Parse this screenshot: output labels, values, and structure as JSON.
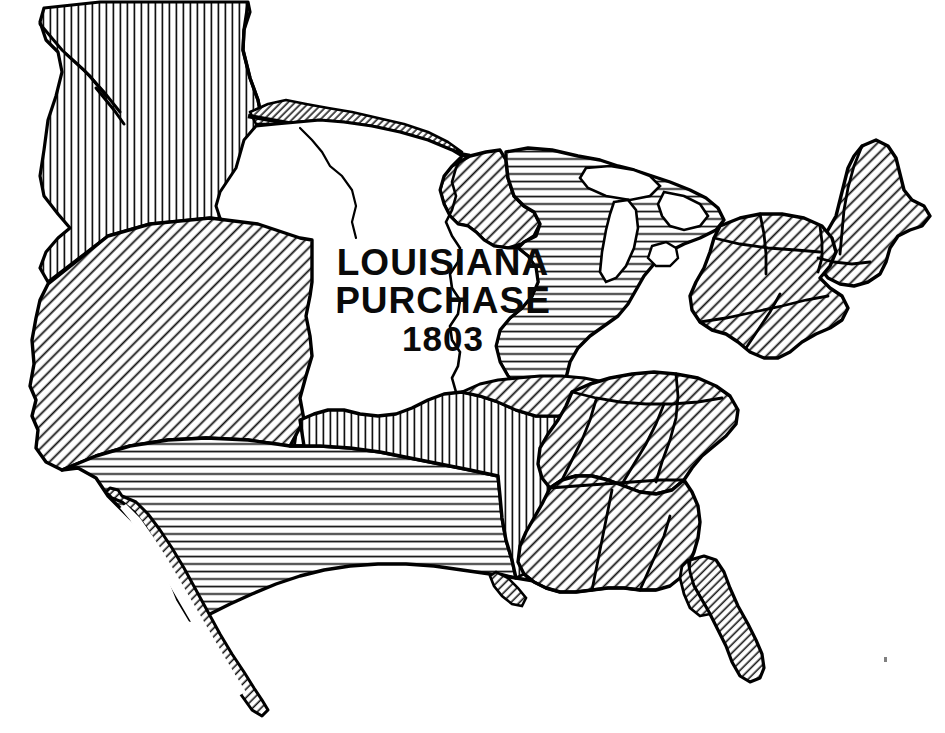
{
  "map": {
    "title_lines": [
      "LOUISIANA",
      "PURCHASE",
      "1803"
    ],
    "year": "1803",
    "subject": "Louisiana Purchase territory within the United States",
    "style": "black and white pen-and-ink hatched historical map",
    "background_color": "#ffffff",
    "ink_color": "#000000",
    "regions": [
      {
        "id": "oregon-country",
        "name": "Oregon Country",
        "hatch": "vertical",
        "label": ""
      },
      {
        "id": "mexican-cession",
        "name": "Mexican Cession",
        "hatch": "diagonal-45",
        "label": ""
      },
      {
        "id": "southwest-cession",
        "name": "Southwestern Cession",
        "hatch": "horizontal",
        "label": ""
      },
      {
        "id": "texas-annexation",
        "name": "Texas Annexation",
        "hatch": "vertical",
        "label": ""
      },
      {
        "id": "louisiana-purchase",
        "name": "Louisiana Purchase",
        "hatch": "none",
        "label": "LOUISIANA PURCHASE 1803"
      },
      {
        "id": "northern-border-strip",
        "name": "Northern Border Strip",
        "hatch": "diagonal-45",
        "label": ""
      },
      {
        "id": "minnesota-wedge",
        "name": "Minnesota Wedge",
        "hatch": "diagonal-45",
        "label": ""
      },
      {
        "id": "old-northwest",
        "name": "Old Northwest",
        "hatch": "horizontal",
        "label": ""
      },
      {
        "id": "original-states",
        "name": "Original States / East",
        "hatch": "diagonal-45",
        "label": ""
      },
      {
        "id": "florida",
        "name": "Florida",
        "hatch": "diagonal-45",
        "label": ""
      },
      {
        "id": "baja-california",
        "name": "Baja California",
        "hatch": "diagonal-45",
        "label": ""
      }
    ],
    "features": [
      {
        "id": "mississippi-river",
        "name": "Mississippi River boundary",
        "type": "river-line"
      },
      {
        "id": "missouri-river",
        "name": "Missouri River boundary",
        "type": "river-line"
      },
      {
        "id": "great-lakes",
        "name": "Great Lakes",
        "type": "water-body"
      },
      {
        "id": "gulf-of-california",
        "name": "Gulf of California",
        "type": "water-body"
      },
      {
        "id": "49th-parallel",
        "name": "49th Parallel border",
        "type": "border-line"
      }
    ],
    "colors": {
      "ink": "#000000",
      "paper": "#ffffff",
      "hatch": "#111111"
    }
  }
}
